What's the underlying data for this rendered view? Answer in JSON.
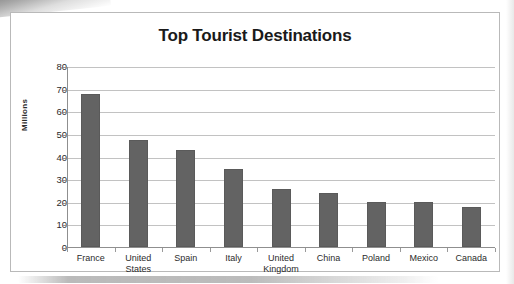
{
  "chart_data": {
    "type": "bar",
    "title": "Top Tourist Destinations",
    "xlabel": "",
    "ylabel": "Millions",
    "categories": [
      "France",
      "United States",
      "Spain",
      "Italy",
      "United Kingdom",
      "China",
      "Poland",
      "Mexico",
      "Canada"
    ],
    "values": [
      67.5,
      47.5,
      43,
      34.5,
      25.5,
      24,
      20,
      20,
      17.5
    ],
    "ylim": [
      0,
      80
    ],
    "ytick_labels": [
      "80",
      "70",
      "60",
      "50",
      "40",
      "30",
      "20",
      "10",
      "0"
    ],
    "ytick_values": [
      80,
      70,
      60,
      50,
      40,
      30,
      20,
      10,
      0
    ],
    "grid": true,
    "legend": false,
    "bar_color": "#636363",
    "gridline_color": "#c2c2c2",
    "axis_color": "#8f8f8f",
    "text_color": "#2b2b2b",
    "border_color": "#b9b9b9"
  }
}
